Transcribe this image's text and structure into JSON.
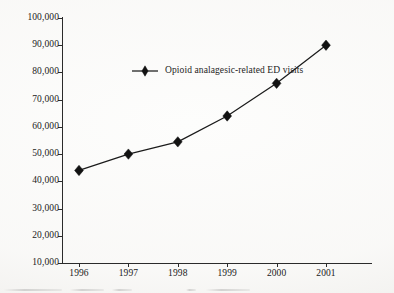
{
  "chart_data": {
    "type": "line",
    "title": "",
    "subtitle": "",
    "xlabel": "",
    "ylabel": "",
    "categories": [
      "1996",
      "1997",
      "1998",
      "1999",
      "2000",
      "2001"
    ],
    "x": [
      1996,
      1997,
      1998,
      1999,
      2000,
      2001
    ],
    "series": [
      {
        "name": "Opioid analagesic-related ED visits",
        "values": [
          44000,
          50000,
          54500,
          64000,
          76000,
          90000
        ],
        "marker": "diamond",
        "color": "#121212"
      }
    ],
    "ylim": [
      10000,
      100000
    ],
    "ytick_values": [
      10000,
      20000,
      30000,
      40000,
      50000,
      60000,
      70000,
      80000,
      90000,
      100000
    ],
    "ytick_labels": [
      "10,000",
      "20,000",
      "30,000",
      "40,000",
      "50,000",
      "60,000",
      "70,000",
      "80,000",
      "90,000",
      "100,000"
    ],
    "xtick_labels": [
      "1996",
      "1997",
      "1998",
      "1999",
      "2000",
      "2001"
    ],
    "grid": false,
    "legend_position": "upper-left-inside",
    "axes_visible": [
      "left",
      "bottom"
    ]
  },
  "legend": {
    "entries": [
      {
        "label": "Opioid analagesic-related ED visits",
        "marker_icon": "diamond-marker-icon",
        "color": "#121212"
      }
    ],
    "primary_label": "Opioid analagesic-related ED visits"
  },
  "axes": {
    "y": {
      "labels": [
        "100,000",
        "90,000",
        "80,000",
        "70,000",
        "60,000",
        "50,000",
        "40,000",
        "30,000",
        "20,000",
        "10,000"
      ]
    },
    "x": {
      "labels": [
        "1996",
        "1997",
        "1998",
        "1999",
        "2000",
        "2001"
      ]
    }
  },
  "colors": {
    "ink": "#1b1b1b",
    "axis": "#2b2b2b",
    "paper": "#fdfdfc"
  }
}
